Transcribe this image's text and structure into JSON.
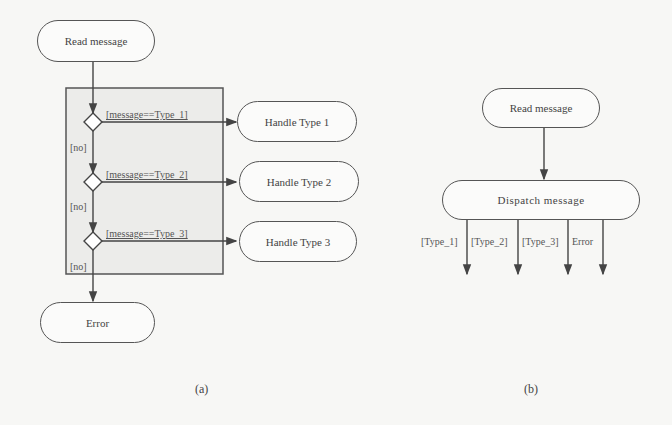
{
  "diagram_a": {
    "caption": "(a)",
    "start": "Read message",
    "conditions": [
      {
        "guard": "[message==Type_1]",
        "target": "Handle Type 1"
      },
      {
        "guard": "[message==Type_2]",
        "target": "Handle Type 2"
      },
      {
        "guard": "[message==Type_3]",
        "target": "Handle Type 3"
      }
    ],
    "no_label": "[no]",
    "end": "Error"
  },
  "diagram_b": {
    "caption": "(b)",
    "start": "Read message",
    "dispatch": "Dispatch message",
    "branches": [
      "[Type_1]",
      "[Type_2]",
      "[Type_3]",
      "Error"
    ]
  },
  "colors": {
    "line": "#555555",
    "frame_fill": "#ececea",
    "background": "#f7f7f5"
  }
}
